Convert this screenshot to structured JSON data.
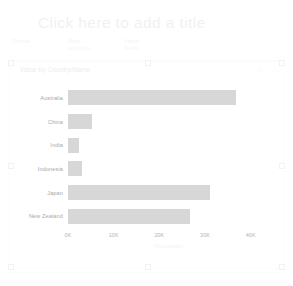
{
  "report": {
    "title_placeholder": "Click here to add a title"
  },
  "toolbar": {
    "groups": [
      {
        "title": "Format",
        "sub": ""
      },
      {
        "title": "Data",
        "sub": "Analytics",
        "caret": "▾"
      },
      {
        "title": "Visual",
        "sub": "Fields"
      }
    ]
  },
  "visual": {
    "title": "Value by Country/Name",
    "menu_icon": "⋯",
    "focus_icon": "⤡"
  },
  "chart_data": {
    "type": "bar",
    "orientation": "horizontal",
    "title": "Value by Country/Name",
    "xlabel": "(Thousands)",
    "ylabel": "Country/Name",
    "categories": [
      "Australia",
      "China",
      "India",
      "Indonesia",
      "Japan",
      "New Zealand"
    ],
    "values": [
      36800,
      5200,
      2500,
      3100,
      31000,
      26700
    ],
    "series": [
      {
        "name": "Value",
        "values": [
          36800,
          5200,
          2500,
          3100,
          31000,
          26700
        ]
      }
    ],
    "xlim": [
      0,
      44000
    ],
    "xticks": [
      0,
      10000,
      20000,
      30000,
      40000
    ],
    "xtick_labels": [
      "0K",
      "10K",
      "20K",
      "30K",
      "40K"
    ],
    "grid": false,
    "legend": "none",
    "bar_color": "#d7d7d7"
  }
}
